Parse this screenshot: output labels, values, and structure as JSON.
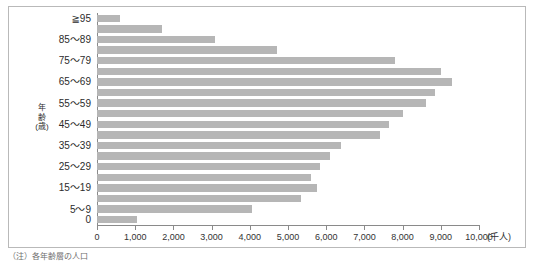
{
  "figure": {
    "caption": "（注）各年齢層の人口",
    "bar_color": "#b6b6b6",
    "axis_color": "#8a8a8a",
    "frame_color": "#b9b9b9"
  },
  "yaxis_title": {
    "line1": "年",
    "line2": "齢",
    "line3": "(歳)"
  },
  "chart_data": {
    "type": "bar",
    "orientation": "horizontal",
    "title": "",
    "xlabel": "(千人)",
    "ylabel": "年齢(歳)",
    "xlim": [
      0,
      10000
    ],
    "grid": false,
    "legend": null,
    "unit": "千人",
    "xticks": [
      0,
      1000,
      2000,
      3000,
      4000,
      5000,
      6000,
      7000,
      8000,
      9000,
      10000
    ],
    "xtick_labels": [
      "0",
      "1,000",
      "2,000",
      "3,000",
      "4,000",
      "5,000",
      "6,000",
      "7,000",
      "8,000",
      "9,000",
      "10,000"
    ],
    "categories": [
      "≧95",
      "90～94",
      "85～89",
      "80～84",
      "75～79",
      "70～74",
      "65～69",
      "60～64",
      "55～59",
      "50～54",
      "45～49",
      "40～44",
      "35～39",
      "30～34",
      "25～29",
      "20～24",
      "15～19",
      "10～14",
      "5～9",
      "0"
    ],
    "visible_tick_labels": [
      "≧95",
      "",
      "85～89",
      "",
      "75～79",
      "",
      "65～69",
      "",
      "55～59",
      "",
      "45～49",
      "",
      "35～39",
      "",
      "25～29",
      "",
      "15～19",
      "",
      "5～9",
      "0"
    ],
    "values": [
      600,
      1700,
      3100,
      4700,
      7800,
      9000,
      9300,
      8850,
      8600,
      8000,
      7650,
      7400,
      6400,
      6100,
      5850,
      5600,
      5750,
      5350,
      4050,
      1050
    ]
  }
}
